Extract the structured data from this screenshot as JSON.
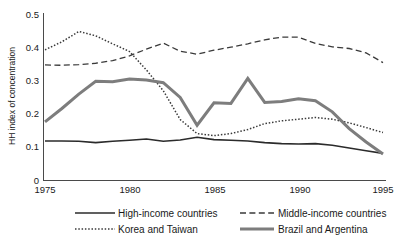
{
  "chart_data": {
    "type": "line",
    "title": "",
    "subtitle": "",
    "xlabel": "",
    "ylabel": "HH index of concentration",
    "xlim": [
      1975,
      1995
    ],
    "ylim": [
      0,
      0.5
    ],
    "grid": false,
    "legend_position": "bottom",
    "x": [
      1975,
      1976,
      1977,
      1978,
      1979,
      1980,
      1981,
      1982,
      1983,
      1984,
      1985,
      1986,
      1987,
      1988,
      1989,
      1990,
      1991,
      1992,
      1993,
      1994,
      1995
    ],
    "xticks": [
      1975,
      1980,
      1985,
      1990,
      1995
    ],
    "xtick_labels": [
      "1975",
      "1980",
      "1985",
      "1990",
      "1995"
    ],
    "yticks": [
      0,
      0.1,
      0.2,
      0.3,
      0.4,
      0.5
    ],
    "ytick_labels": [
      "0",
      "0.1",
      "0.2",
      "0.3",
      "0.4",
      "0.5"
    ],
    "series": [
      {
        "name": "High-income countries",
        "style": "solid-black",
        "color": "#2b2b2b",
        "width": 1.6,
        "dash": "none",
        "values": [
          0.118,
          0.118,
          0.117,
          0.113,
          0.117,
          0.12,
          0.124,
          0.117,
          0.121,
          0.129,
          0.122,
          0.12,
          0.118,
          0.113,
          0.11,
          0.109,
          0.11,
          0.105,
          0.097,
          0.089,
          0.081
        ]
      },
      {
        "name": "Middle-income countries",
        "style": "dashed",
        "color": "#3a3a3a",
        "width": 1.3,
        "dash": "6,3.4",
        "values": [
          0.345,
          0.344,
          0.346,
          0.35,
          0.358,
          0.372,
          0.392,
          0.41,
          0.386,
          0.377,
          0.389,
          0.398,
          0.408,
          0.42,
          0.428,
          0.428,
          0.409,
          0.399,
          0.394,
          0.381,
          0.352
        ]
      },
      {
        "name": "Korea and Taiwan",
        "style": "dotted",
        "color": "#3a3a3a",
        "width": 1.5,
        "dash": "1.5,1.8",
        "values": [
          0.39,
          0.414,
          0.445,
          0.432,
          0.408,
          0.385,
          0.33,
          0.268,
          0.182,
          0.14,
          0.134,
          0.14,
          0.152,
          0.17,
          0.178,
          0.183,
          0.188,
          0.183,
          0.172,
          0.158,
          0.143
        ]
      },
      {
        "name": "Brazil and Argentina",
        "style": "solid-gray",
        "color": "#7d7d7d",
        "width": 3.0,
        "dash": "none",
        "values": [
          0.175,
          0.215,
          0.258,
          0.296,
          0.295,
          0.303,
          0.3,
          0.292,
          0.248,
          0.165,
          0.232,
          0.23,
          0.305,
          0.233,
          0.236,
          0.244,
          0.238,
          0.205,
          0.155,
          0.115,
          0.079
        ]
      }
    ]
  },
  "legend": {
    "items": [
      {
        "label": "High-income countries",
        "swatch": "solid-black"
      },
      {
        "label": "Middle-income countries",
        "swatch": "dashed"
      },
      {
        "label": "Korea and Taiwan",
        "swatch": "dotted"
      },
      {
        "label": "Brazil and Argentina",
        "swatch": "solid-gray"
      }
    ]
  }
}
